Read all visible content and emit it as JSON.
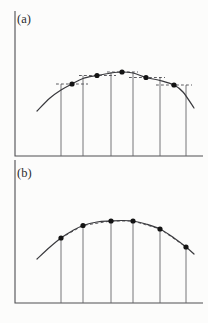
{
  "figure": {
    "background_color": "#fcfcfb",
    "axis_color": "#4e4e52",
    "vertical_line_color": "#66666a",
    "curve_color": "#39393d",
    "dash_color": "#4a4a4e",
    "dot_color": "#141414",
    "dot_radius": 2.6,
    "panels": [
      {
        "label": "(a)",
        "axis": {
          "x_left": 15,
          "y_top": 11,
          "y_base": 156,
          "x_right": 203
        },
        "verticals_x": [
          61,
          83,
          111,
          133,
          160,
          186
        ],
        "vertical_tops_y": [
          84,
          75.5,
          72,
          72,
          77.5,
          85
        ],
        "curve_points": [
          [
            37,
            111
          ],
          [
            50,
            98
          ],
          [
            61,
            90
          ],
          [
            72,
            84
          ],
          [
            83,
            78.5
          ],
          [
            97,
            75.5
          ],
          [
            111,
            73
          ],
          [
            122,
            72
          ],
          [
            133,
            73
          ],
          [
            146,
            77.5
          ],
          [
            160,
            80.5
          ],
          [
            174,
            85
          ],
          [
            183,
            92
          ],
          [
            194,
            108
          ]
        ],
        "dots": [
          [
            72,
            84
          ],
          [
            97,
            75.5
          ],
          [
            122,
            72
          ],
          [
            146,
            77.5
          ],
          [
            174,
            85
          ]
        ],
        "dashes": [
          {
            "y": 84,
            "x1": 56,
            "x2": 88
          },
          {
            "y": 75.5,
            "x1": 79,
            "x2": 116
          },
          {
            "y": 72,
            "x1": 107,
            "x2": 138
          },
          {
            "y": 77.5,
            "x1": 129,
            "x2": 165
          },
          {
            "y": 85,
            "x1": 156,
            "x2": 192
          }
        ]
      },
      {
        "label": "(b)",
        "axis": {
          "x_left": 15,
          "y_top": 160,
          "y_base": 303,
          "x_right": 203
        },
        "verticals_x": [
          61,
          83,
          111,
          133,
          160,
          186
        ],
        "vertical_tops_y": [
          238,
          225.5,
          221,
          221,
          229,
          247
        ],
        "curve_points": [
          [
            37,
            259
          ],
          [
            50,
            247
          ],
          [
            61,
            238
          ],
          [
            72,
            231
          ],
          [
            83,
            225.5
          ],
          [
            97,
            222
          ],
          [
            111,
            221
          ],
          [
            122,
            220.5
          ],
          [
            133,
            221
          ],
          [
            146,
            224
          ],
          [
            160,
            229
          ],
          [
            174,
            238
          ],
          [
            186,
            247
          ],
          [
            194,
            254
          ]
        ],
        "dots": [
          [
            61,
            238
          ],
          [
            83,
            225.5
          ],
          [
            111,
            221
          ],
          [
            133,
            221
          ],
          [
            160,
            229
          ],
          [
            186,
            247
          ]
        ],
        "chord_points": [
          [
            61,
            238
          ],
          [
            83,
            225.5
          ],
          [
            111,
            221
          ],
          [
            133,
            221
          ],
          [
            160,
            229
          ],
          [
            186,
            247
          ]
        ]
      }
    ]
  }
}
